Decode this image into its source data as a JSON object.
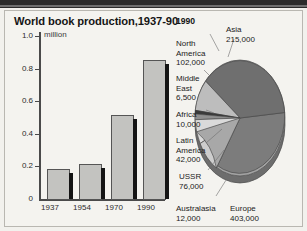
{
  "figure": {
    "title": "World book production,1937-90",
    "unit_label": "million"
  },
  "chart_data": [
    {
      "type": "bar",
      "title": "World book production,1937-90",
      "xlabel": "",
      "ylabel": "million",
      "categories": [
        "1937",
        "1954",
        "1970",
        "1990"
      ],
      "values": [
        0.19,
        0.22,
        0.52,
        0.86
      ],
      "ylim": [
        0,
        1.0
      ],
      "ytick_labels": [
        "1.0",
        "0.8",
        "0.6",
        "0.4",
        "0.2",
        "0"
      ],
      "ytick_values": [
        1.0,
        0.8,
        0.6,
        0.4,
        0.2,
        0
      ],
      "grid": false,
      "legend": "none",
      "bar_color": "#c3c3c0",
      "bar_edge_color": "#555555",
      "shadow_color": "#141414"
    },
    {
      "type": "pie",
      "title": "1990",
      "value_unit": "books",
      "total": 866500,
      "legend": "labels-around-pie",
      "labels": [
        "Asia",
        "North America",
        "Middle East",
        "Africa",
        "Latin America",
        "USSR",
        "Australasia",
        "Europe"
      ],
      "values": [
        215000,
        102000,
        6500,
        10000,
        42000,
        76000,
        12000,
        403000
      ],
      "value_text": [
        "215,000",
        "102,000",
        "6,500",
        "10,000",
        "42,000",
        "76,000",
        "12,000",
        "403,000"
      ],
      "slice_colors": [
        "#6f6f6f",
        "#bdbdbd",
        "#3a3a3a",
        "#8f8f8f",
        "#dadada",
        "#cdcdcd",
        "#a8a8a8",
        "#7c7c7c"
      ]
    }
  ],
  "bar_chart": {
    "year_labels": [
      "1937",
      "1954",
      "1970",
      "1990"
    ],
    "y_labels": [
      "1.0",
      "0.8",
      "0.6",
      "0.4",
      "0.2",
      "0"
    ]
  },
  "pie_chart": {
    "year": "1990",
    "entries": [
      {
        "name": "North\nAmerica",
        "value": "102,000"
      },
      {
        "name": "Middle\nEast",
        "value": "6,500"
      },
      {
        "name": "Africa",
        "value": "10,000"
      },
      {
        "name": "Latin\nAmerica",
        "value": "42,000"
      },
      {
        "name": "USSR",
        "value": "76,000"
      },
      {
        "name": "Australasia",
        "value": "12,000"
      },
      {
        "name": "Europe",
        "value": "403,000"
      },
      {
        "name": "Asia",
        "value": "215,000"
      }
    ]
  }
}
